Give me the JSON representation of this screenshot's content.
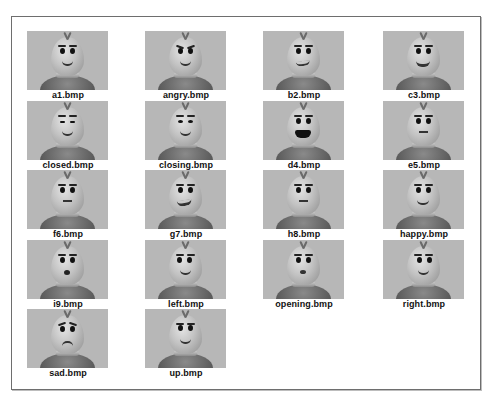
{
  "gallery": {
    "items": [
      {
        "label": "a1.bmp",
        "variant": "a1"
      },
      {
        "label": "angry.bmp",
        "variant": "angry"
      },
      {
        "label": "b2.bmp",
        "variant": "b2"
      },
      {
        "label": "c3.bmp",
        "variant": "c3"
      },
      {
        "label": "closed.bmp",
        "variant": "closed"
      },
      {
        "label": "closing.bmp",
        "variant": "closing"
      },
      {
        "label": "d4.bmp",
        "variant": "d4"
      },
      {
        "label": "e5.bmp",
        "variant": "e5"
      },
      {
        "label": "f6.bmp",
        "variant": "f6"
      },
      {
        "label": "g7.bmp",
        "variant": "g7"
      },
      {
        "label": "h8.bmp",
        "variant": "h8"
      },
      {
        "label": "happy.bmp",
        "variant": "happy"
      },
      {
        "label": "i9.bmp",
        "variant": "i9"
      },
      {
        "label": "left.bmp",
        "variant": "left"
      },
      {
        "label": "opening.bmp",
        "variant": "opening"
      },
      {
        "label": "right.bmp",
        "variant": "right"
      },
      {
        "label": "sad.bmp",
        "variant": "sad"
      },
      {
        "label": "up.bmp",
        "variant": "up"
      }
    ]
  },
  "colors": {
    "thumb_background": "#b7b7b7",
    "frame_border": "#6e6e6e",
    "label_text": "#111111"
  }
}
